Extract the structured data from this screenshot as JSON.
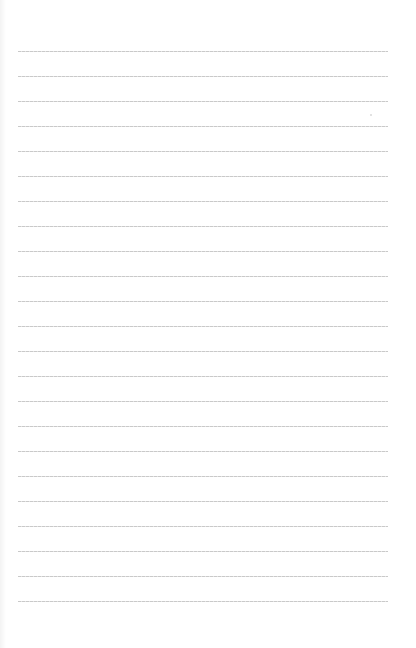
{
  "page": {
    "type": "lined-paper",
    "background": "#ffffff",
    "line_color": "#c9c9c9",
    "line_count": 23,
    "first_line_y": 51,
    "line_spacing": 25,
    "line_left": 18,
    "line_right": 388,
    "content_text": ""
  }
}
